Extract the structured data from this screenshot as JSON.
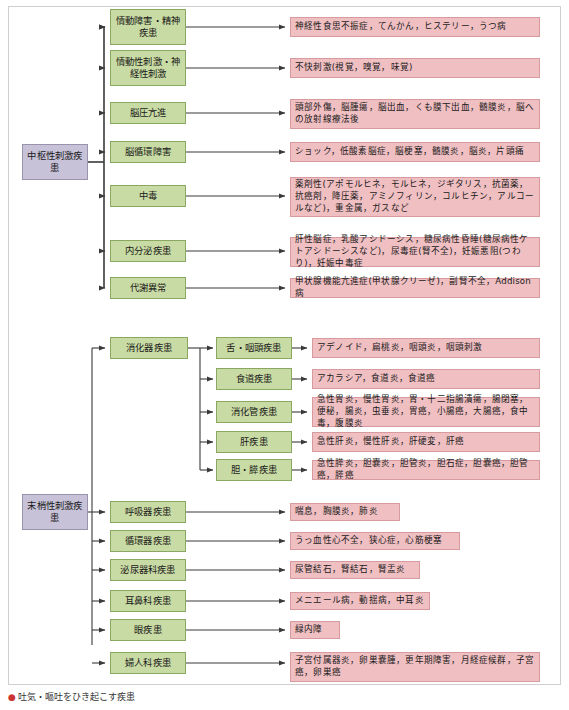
{
  "figure": {
    "caption_bullet": "●",
    "caption_text": "吐気・嘔吐をひき起こす疾患"
  },
  "roots": [
    {
      "id": "central",
      "label": "中枢性刺激疾患"
    },
    {
      "id": "peripheral",
      "label": "末梢性刺激疾患"
    }
  ],
  "central_categories": [
    {
      "label": "情動障害・精神疾患",
      "detail": "神経性食思不振症，てんかん，ヒステリー，うつ病"
    },
    {
      "label": "情動性刺激・神経性刺激",
      "detail": "不快刺激(視覚，嗅覚，味覚)"
    },
    {
      "label": "脳圧亢進",
      "detail": "頭部外傷，脳腫瘍，脳出血，くも膜下出血，髄膜炎，脳への放射線療法後"
    },
    {
      "label": "脳循環障害",
      "detail": "ショック，低酸素脳症，脳梗塞，髄膜炎，脳炎，片頭痛"
    },
    {
      "label": "中毒",
      "detail": "薬剤性(アポモルヒネ，モルヒネ，ジギタリス，抗菌薬，抗癌剤，降圧薬，アミノフィリン，コルヒチン，アルコールなど)，重金属，ガスなど"
    },
    {
      "label": "内分泌疾患",
      "detail": "肝性脳症，乳酸アシドーシス，糖尿病性昏睡(糖尿病性ケトアシドーシスなど)，尿毒症(腎不全)，妊娠悪阻(つわり)，妊娠中毒症"
    },
    {
      "label": "代謝異常",
      "detail": "甲状腺機能亢進症(甲状腺クリーゼ)，副腎不全，Addison病"
    }
  ],
  "digestive": {
    "label": "消化器疾患",
    "subcategories": [
      {
        "label": "舌・咽頭疾患",
        "detail": "アデノイド，扁桃炎，咽頭炎，咽頭刺激"
      },
      {
        "label": "食道疾患",
        "detail": "アカラシア，食道炎，食道癌"
      },
      {
        "label": "消化管疾患",
        "detail": "急性胃炎，慢性胃炎，胃・十二指腸潰瘍，腸閉塞，便秘，腸炎，虫垂炎，胃癌，小腸癌，大腸癌，食中毒，腹膜炎"
      },
      {
        "label": "肝疾患",
        "detail": "急性肝炎，慢性肝炎，肝硬変，肝癌"
      },
      {
        "label": "胆・膵疾患",
        "detail": "急性膵炎，胆嚢炎，胆管炎，胆石症，胆嚢癌，胆管癌，膵癌"
      }
    ]
  },
  "peripheral_categories": [
    {
      "label": "呼吸器疾患",
      "detail": "喘息，胸膜炎，肺炎"
    },
    {
      "label": "循環器疾患",
      "detail": "うっ血性心不全，狭心症，心筋梗塞"
    },
    {
      "label": "泌尿器科疾患",
      "detail": "尿管結石，腎結石，腎盂炎"
    },
    {
      "label": "耳鼻科疾患",
      "detail": "メニエール病，動揺病，中耳炎"
    },
    {
      "label": "眼疾患",
      "detail": "緑内障"
    },
    {
      "label": "婦人科疾患",
      "detail": "子宮付属器炎，卵巣嚢腫，更年期障害，月経症候群，子宮癌，卵巣癌"
    }
  ],
  "colors": {
    "root_fill": "#c8c2d8",
    "root_stroke": "#9a93ae",
    "category_fill": "#c9dba4",
    "category_stroke": "#8aa861",
    "detail_fill": "#f0bfc2",
    "detail_stroke": "#d79a9e",
    "connector": "#3a3a3a",
    "frame": "#cfcfcf"
  }
}
